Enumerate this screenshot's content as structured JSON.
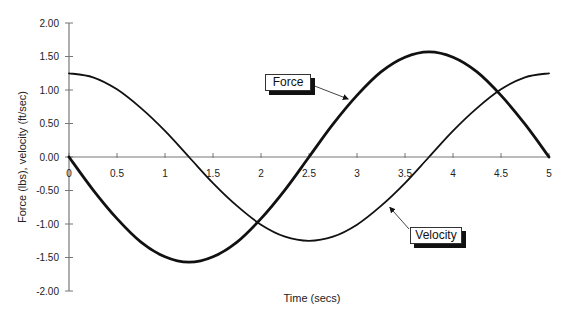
{
  "chart_data": {
    "type": "line",
    "title": "",
    "xlabel": "Time (secs)",
    "ylabel": "Force (lbs), velocity (ft/sec)",
    "xlim": [
      0,
      5
    ],
    "ylim": [
      -2.0,
      2.0
    ],
    "x_ticks": [
      "0",
      "0.5",
      "1",
      "1.5",
      "2",
      "2.5",
      "3",
      "3.5",
      "4",
      "4.5",
      "5"
    ],
    "y_ticks": [
      "2.00",
      "1.50",
      "1.00",
      "0.50",
      "0.00",
      "-0.50",
      "-1.00",
      "-1.50",
      "-2.00"
    ],
    "grid": false,
    "legend": "callout labels",
    "x": [
      0,
      0.25,
      0.5,
      0.75,
      1.0,
      1.25,
      1.5,
      1.75,
      2.0,
      2.25,
      2.5,
      2.75,
      3.0,
      3.25,
      3.5,
      3.75,
      4.0,
      4.25,
      4.5,
      4.75,
      5.0
    ],
    "series": [
      {
        "name": "Force",
        "style": "thick",
        "values": [
          0.0,
          -0.49,
          -0.92,
          -1.27,
          -1.49,
          -1.57,
          -1.49,
          -1.27,
          -0.92,
          -0.49,
          0.0,
          0.49,
          0.92,
          1.27,
          1.49,
          1.57,
          1.49,
          1.27,
          0.92,
          0.49,
          0.0
        ]
      },
      {
        "name": "Velocity",
        "style": "thin",
        "values": [
          1.25,
          1.19,
          1.01,
          0.73,
          0.39,
          0.0,
          -0.39,
          -0.73,
          -1.01,
          -1.19,
          -1.25,
          -1.19,
          -1.01,
          -0.73,
          -0.39,
          0.0,
          0.39,
          0.73,
          1.01,
          1.19,
          1.25
        ]
      }
    ],
    "annotations": [
      {
        "label": "Force",
        "points_to_x": 2.93,
        "points_to_y": 0.85
      },
      {
        "label": "Velocity",
        "points_to_x": 3.32,
        "points_to_y": -0.72
      }
    ]
  },
  "labels": {
    "force": "Force",
    "velocity": "Velocity",
    "xlabel": "Time (secs)",
    "ylabel": "Force (lbs), velocity (ft/sec)"
  }
}
